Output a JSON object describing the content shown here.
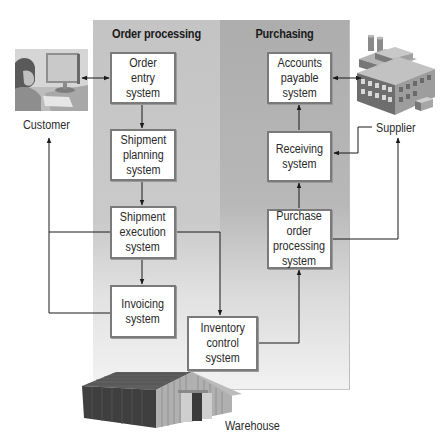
{
  "diagram": {
    "lanes": [
      {
        "id": "order",
        "title": "Order processing"
      },
      {
        "id": "purchasing",
        "title": "Purchasing"
      }
    ],
    "systems": {
      "order_entry": "Order\nentry\nsystem",
      "shipment_planning": "Shipment\nplanning\nsystem",
      "shipment_execution": "Shipment\nexecution\nsystem",
      "invoicing": "Invoicing\nsystem",
      "inventory_control": "Inventory\ncontrol\nsystem",
      "accounts_payable": "Accounts\npayable\nsystem",
      "receiving": "Receiving\nsystem",
      "purchase_order_processing": "Purchase\norder\nprocessing\nsystem"
    },
    "actors": {
      "customer": "Customer",
      "supplier": "Supplier",
      "warehouse": "Warehouse"
    },
    "icons": {
      "customer": "person-at-computer-icon",
      "supplier": "factory-building-icon",
      "warehouse": "warehouse-building-icon"
    },
    "flows": [
      {
        "from": "Customer",
        "to": "Order entry system",
        "type": "bidirectional"
      },
      {
        "from": "Order entry system",
        "to": "Shipment planning system"
      },
      {
        "from": "Shipment planning system",
        "to": "Shipment execution system"
      },
      {
        "from": "Shipment execution system",
        "to": "Invoicing system"
      },
      {
        "from": "Shipment execution system",
        "to": "Inventory control system"
      },
      {
        "from": "Shipment execution system",
        "to": "Customer"
      },
      {
        "from": "Invoicing system",
        "to": "Customer"
      },
      {
        "from": "Inventory control system",
        "to": "Purchase order processing system"
      },
      {
        "from": "Purchase order processing system",
        "to": "Receiving system"
      },
      {
        "from": "Purchase order processing system",
        "to": "Supplier"
      },
      {
        "from": "Receiving system",
        "to": "Accounts payable system"
      },
      {
        "from": "Supplier",
        "to": "Receiving system"
      },
      {
        "from": "Accounts payable system",
        "to": "Supplier",
        "type": "bidirectional"
      }
    ],
    "colors": {
      "order_lane": "#c4c4c4",
      "purchasing_lane": "#adadad",
      "box_border": "#7a7a7a",
      "line": "#1a1a1a"
    }
  }
}
